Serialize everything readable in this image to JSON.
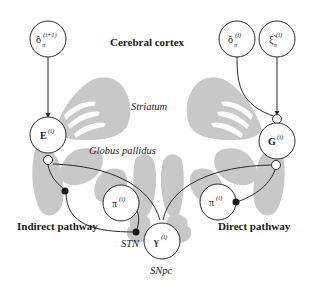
{
  "labels": {
    "cortex": "Cerebral cortex",
    "striatum": "Striatum",
    "globus_pallidus": "Globus pallidus",
    "indirect": "Indirect pathway",
    "direct": "Direct pathway",
    "stn": "STN",
    "snpc": "SNpc"
  },
  "nodes": {
    "o_next": {
      "base": "õ",
      "sub": "π",
      "sup": "(i+1)"
    },
    "E": {
      "base": "E",
      "sup": "(i)"
    },
    "o_cur": {
      "base": "õ",
      "sub": "π",
      "sup": "(i)"
    },
    "xi": {
      "base": "ξ̃",
      "sub": "π",
      "sup": "(i)"
    },
    "G": {
      "base": "G",
      "sup": "(i)"
    },
    "pi_left": {
      "base": "π",
      "sup": "(i)"
    },
    "pi_right": {
      "base": "π",
      "sup": "(i)"
    },
    "gamma": {
      "base": "γ",
      "sup": "(i)"
    }
  },
  "colors": {
    "brain_shape": "#c8c8c8",
    "line": "#2a2a2a",
    "background": "#ffffff"
  }
}
